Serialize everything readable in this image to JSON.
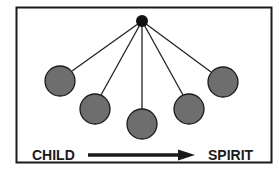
{
  "diagram": {
    "labels": {
      "left": "CHILD",
      "right": "SPIRIT"
    },
    "colors": {
      "border": "#1a1a1a",
      "line": "#222222",
      "hub": "#111111",
      "node_fill": "#6e6e6e",
      "node_stroke": "#1a1a1a",
      "arrow": "#1a1a1a"
    },
    "hub": {
      "cx": 142,
      "cy": 21,
      "r": 6
    },
    "nodes": [
      {
        "id": "node-1",
        "cx": 60,
        "cy": 81,
        "r": 15
      },
      {
        "id": "node-2",
        "cx": 95,
        "cy": 109,
        "r": 15
      },
      {
        "id": "node-3",
        "cx": 142,
        "cy": 124,
        "r": 15
      },
      {
        "id": "node-4",
        "cx": 189,
        "cy": 109,
        "r": 15
      },
      {
        "id": "node-5",
        "cx": 223,
        "cy": 82,
        "r": 15
      }
    ],
    "arrow": {
      "direction": "left-to-right",
      "from": "CHILD",
      "to": "SPIRIT"
    }
  }
}
